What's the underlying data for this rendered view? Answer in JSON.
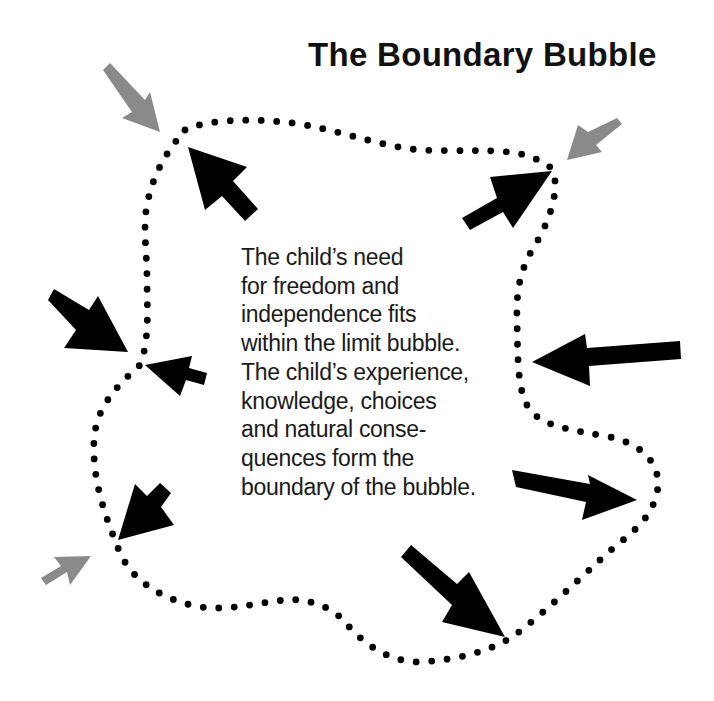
{
  "title": "The Boundary Bubble",
  "description": {
    "lines": [
      "The child’s need",
      "for freedom and",
      "independence fits",
      "within the limit bubble.",
      "The child’s experience,",
      "knowledge, choices",
      "and natural conse-",
      "quences form the",
      "boundary of the bubble."
    ]
  },
  "colors": {
    "background": "#ffffff",
    "dots": "#000000",
    "black_arrow": "#000000",
    "gray_arrow": "#8a8a8a",
    "text": "#1a1a1a"
  },
  "boundary": {
    "style": "dotted",
    "dot_radius": 3.4,
    "dot_spacing": 15.5,
    "path": "M185,130 C205,120 250,117 300,124 C345,132 380,146 420,150 C460,152 500,148 525,155 C540,160 550,165 552,170 C560,185 552,215 538,240 C522,265 516,285 517,320 C518,360 517,392 530,410 C545,428 575,430 610,437 C650,446 665,472 655,500 C645,528 620,540 600,560 C575,583 545,612 515,635 C490,652 455,660 420,662 C385,662 360,640 345,622 C330,605 305,598 285,600 C255,603 225,612 195,606 C160,598 130,580 118,548 C105,515 92,480 94,440 C96,410 112,390 140,365 C150,340 147,305 147,280 C147,250 142,225 148,200 C155,170 168,150 185,130 Z"
  },
  "arrows": [
    {
      "id": "gray-top-left",
      "color": "gray",
      "points": "103,70 110,63 145,100 150,92 160,132 122,118 132,112"
    },
    {
      "id": "black-top-left-inner",
      "color": "black",
      "points": "258,209 245,221 222,196 205,210 188,147 247,167 233,181"
    },
    {
      "id": "gray-top-right",
      "color": "gray",
      "points": "617,118 622,124 596,145 602,152 567,160 578,125 588,132"
    },
    {
      "id": "black-top-right-inner",
      "color": "black",
      "points": "462,218 470,230 503,212 513,228 552,171 490,177 497,198"
    },
    {
      "id": "black-left-outer",
      "color": "black",
      "points": "48,300 54,289 89,310 98,296 128,352 64,348 76,330"
    },
    {
      "id": "black-left-inner",
      "color": "black",
      "points": "207,373 204,385 186,380 180,396 145,365 192,356 189,368"
    },
    {
      "id": "black-right-middle",
      "color": "black",
      "points": "680,341 681,359 589,366 590,386 532,362 585,334 587,348"
    },
    {
      "id": "black-right-lower",
      "color": "black",
      "points": "512,470 516,487 586,502 582,520 637,500 588,475 590,484"
    },
    {
      "id": "black-lower-left-inner",
      "color": "black",
      "points": "171,493 160,483 147,496 135,484 118,540 174,525 161,507"
    },
    {
      "id": "gray-lower-left",
      "color": "gray",
      "points": "41,578 46,585 67,572 70,585 91,556 54,557 61,566"
    },
    {
      "id": "black-bottom-right",
      "color": "black",
      "points": "401,557 411,545 457,584 469,572 505,637 442,622 452,605"
    }
  ]
}
